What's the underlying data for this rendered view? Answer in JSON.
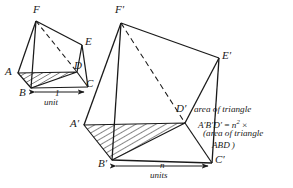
{
  "figure": {
    "stroke_color": "#1a1a1a",
    "background_color": "#ffffff",
    "hatch_color": "#1a1a1a"
  },
  "small_prism": {
    "name": "small prism",
    "vertices": {
      "F": {
        "label": "F",
        "x": 36,
        "y": 21,
        "label_x": 33,
        "label_y": 4
      },
      "E": {
        "label": "E",
        "x": 82,
        "y": 45,
        "label_x": 85,
        "label_y": 36
      },
      "A": {
        "label": "A",
        "x": 18,
        "y": 73,
        "label_x": 5,
        "label_y": 66
      },
      "D": {
        "label": "D",
        "x": 77,
        "y": 72,
        "label_x": 74,
        "label_y": 60
      },
      "B": {
        "label": "B",
        "x": 31,
        "y": 88,
        "label_x": 19,
        "label_y": 87
      },
      "C": {
        "label": "C",
        "x": 88,
        "y": 87,
        "label_x": 86,
        "label_y": 78
      }
    },
    "base_measure": {
      "value": "1",
      "unit_word": "unit",
      "value_x": 55,
      "value_y": 91,
      "unit_x": 48,
      "unit_y": 101
    }
  },
  "large_prism": {
    "name": "large prism",
    "vertices": {
      "F'": {
        "label": "F′",
        "x": 121,
        "y": 23,
        "label_x": 115,
        "label_y": 4
      },
      "E'": {
        "label": "E′",
        "x": 219,
        "y": 58,
        "label_x": 222,
        "label_y": 50
      },
      "A'": {
        "label": "A′",
        "x": 84,
        "y": 125,
        "label_x": 70,
        "label_y": 118
      },
      "D'": {
        "label": "D′",
        "x": 185,
        "y": 123,
        "label_x": 178,
        "label_y": 103
      },
      "B'": {
        "label": "B′",
        "x": 112,
        "y": 160,
        "label_x": 98,
        "label_y": 158
      },
      "C'": {
        "label": "C′",
        "x": 212,
        "y": 163,
        "label_x": 215,
        "label_y": 154
      }
    },
    "base_measure": {
      "value": "n",
      "unit_word": "units",
      "value_x": 160,
      "value_y": 164,
      "unit_x": 152,
      "unit_y": 174
    }
  },
  "annotation": {
    "line1": "area of triangle",
    "line2_prefix": "A′B′D′ = n",
    "line2_exponent": "2",
    "line2_suffix": " ×",
    "line3": "(area of triangle",
    "line4": "ABD )"
  }
}
